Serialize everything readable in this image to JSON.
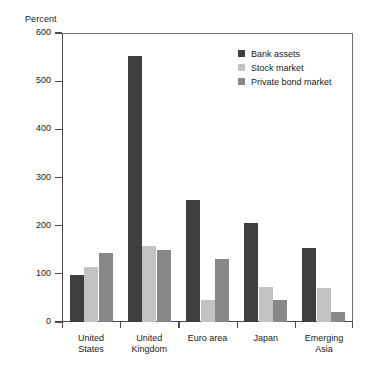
{
  "chart_data": {
    "type": "bar",
    "title": "",
    "subtitle": "",
    "xlabel": "",
    "ylabel": "Percent",
    "ylim": [
      0,
      600
    ],
    "yticks": [
      0,
      100,
      200,
      300,
      400,
      500,
      600
    ],
    "ytick_labels": [
      "0",
      "100",
      "200",
      "300",
      "400",
      "500",
      "600"
    ],
    "grid": false,
    "legend_position": "top-right",
    "categories": [
      "United\nStates",
      "United\nKingdom",
      "Euro area",
      "Japan",
      "Emerging\nAsia"
    ],
    "series": [
      {
        "name": "Bank assets",
        "color": "#3f3f3f",
        "values": [
          97,
          553,
          253,
          205,
          153
        ]
      },
      {
        "name": "Stock market",
        "color": "#c2c2c2",
        "values": [
          115,
          158,
          45,
          72,
          70
        ]
      },
      {
        "name": "Private bond market",
        "color": "#888888",
        "values": [
          143,
          150,
          130,
          45,
          20
        ]
      }
    ]
  },
  "axis": {
    "y_title": "Percent"
  },
  "colors": {
    "bank_assets": "#3f3f3f",
    "stock_market": "#c2c2c2",
    "private_bond_market": "#888888",
    "axis": "#4a4a4a",
    "text": "#1a1a1a",
    "background": "#ffffff"
  }
}
